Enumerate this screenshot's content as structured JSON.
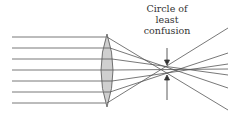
{
  "diagram": {
    "annotation": {
      "lines": [
        "Circle of",
        "least",
        "confusion"
      ]
    },
    "colors": {
      "ray": "#555555",
      "lens_fill": "#cfcfcf",
      "lens_stroke": "#555555",
      "text": "#333333"
    },
    "incoming_rays_y": [
      37,
      48,
      59,
      70,
      81,
      92,
      103
    ],
    "outgoing_rays": [
      {
        "from": [
          107,
          37
        ],
        "to": [
          228,
          110
        ]
      },
      {
        "from": [
          110,
          48
        ],
        "to": [
          228,
          88
        ]
      },
      {
        "from": [
          112,
          59
        ],
        "to": [
          228,
          75
        ]
      },
      {
        "from": [
          114,
          70
        ],
        "to": [
          228,
          69
        ]
      },
      {
        "from": [
          112,
          81
        ],
        "to": [
          228,
          64
        ]
      },
      {
        "from": [
          110,
          92
        ],
        "to": [
          228,
          53
        ]
      },
      {
        "from": [
          107,
          103
        ],
        "to": [
          228,
          28
        ]
      }
    ],
    "lens": {
      "cx": 107,
      "cy": 70,
      "rx": 7,
      "ry": 36
    },
    "arrow_x": 167,
    "focus_point": [
      167,
      70
    ]
  }
}
